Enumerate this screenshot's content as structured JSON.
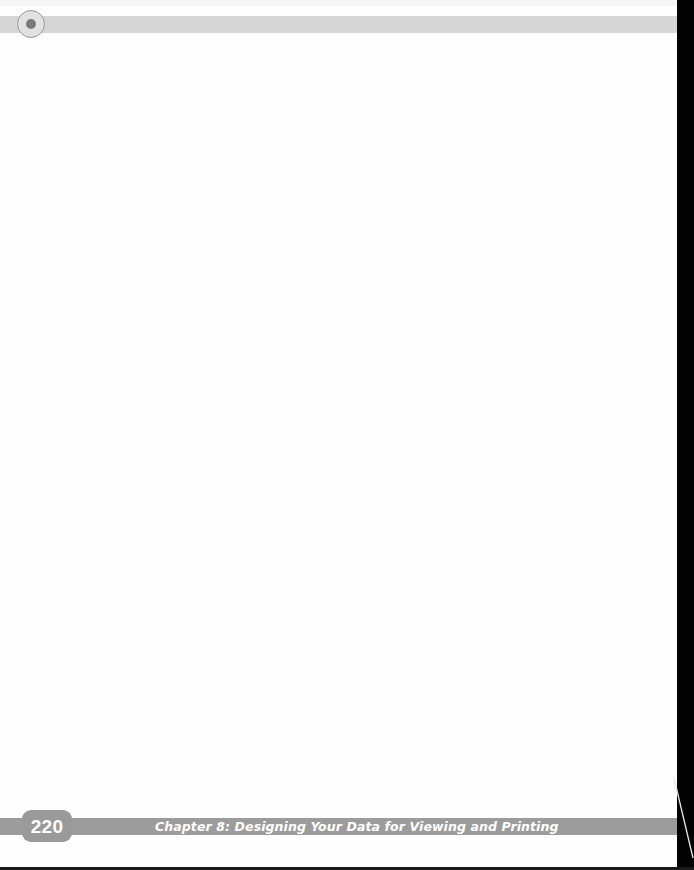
{
  "header": {
    "badge_icon": "target-circle-icon"
  },
  "footer": {
    "page_number": "220",
    "chapter_title": "Chapter 8: Designing Your Data for Viewing and Printing"
  },
  "colors": {
    "header_bar": "#d6d6d6",
    "footer_bar": "#9c9c9c",
    "page_background": "#fefefe",
    "edge_shadow": "#030303"
  }
}
